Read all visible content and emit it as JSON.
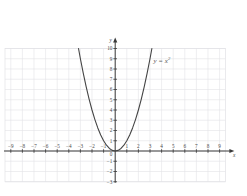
{
  "chart_data": {
    "type": "line",
    "title": "",
    "subtitle": "",
    "xlabel": "x",
    "ylabel": "y",
    "xlim": [
      -9.5,
      9.5
    ],
    "ylim": [
      -3,
      10
    ],
    "grid": true,
    "grid_step": 1,
    "legend": "none",
    "annotations": [
      {
        "text": "y = x",
        "superscript": "2",
        "x": 3.3,
        "y": 8.6
      }
    ],
    "x_ticks": [
      -9,
      -8,
      -7,
      -6,
      -5,
      -4,
      -3,
      -2,
      -1,
      1,
      2,
      3,
      4,
      5,
      6,
      7,
      8,
      9
    ],
    "x_tick_labels": [
      "−9",
      "−8",
      "−7",
      "−6",
      "−5",
      "−4",
      "−3",
      "−2",
      "−1",
      "1",
      "2",
      "3",
      "4",
      "5",
      "6",
      "7",
      "8",
      "9"
    ],
    "y_ticks": [
      -3,
      -2,
      -1,
      1,
      2,
      3,
      4,
      5,
      6,
      7,
      8,
      9,
      10
    ],
    "y_tick_labels": [
      "−3",
      "−2",
      "−1",
      "1",
      "2",
      "3",
      "4",
      "5",
      "6",
      "7",
      "8",
      "9",
      "10"
    ],
    "origin_label": "0",
    "series": [
      {
        "name": "y = x^2",
        "equation": "y = x^2",
        "color": "#444444",
        "width": 1.1,
        "points": [
          {
            "x": -3.1623,
            "y": 10.0
          },
          {
            "x": -3.0,
            "y": 9.0
          },
          {
            "x": -2.75,
            "y": 7.5625
          },
          {
            "x": -2.5,
            "y": 6.25
          },
          {
            "x": -2.25,
            "y": 5.0625
          },
          {
            "x": -2.0,
            "y": 4.0
          },
          {
            "x": -1.75,
            "y": 3.0625
          },
          {
            "x": -1.5,
            "y": 2.25
          },
          {
            "x": -1.25,
            "y": 1.5625
          },
          {
            "x": -1.0,
            "y": 1.0
          },
          {
            "x": -0.75,
            "y": 0.5625
          },
          {
            "x": -0.5,
            "y": 0.25
          },
          {
            "x": -0.25,
            "y": 0.0625
          },
          {
            "x": 0.0,
            "y": 0.0
          },
          {
            "x": 0.25,
            "y": 0.0625
          },
          {
            "x": 0.5,
            "y": 0.25
          },
          {
            "x": 0.75,
            "y": 0.5625
          },
          {
            "x": 1.0,
            "y": 1.0
          },
          {
            "x": 1.25,
            "y": 1.5625
          },
          {
            "x": 1.5,
            "y": 2.25
          },
          {
            "x": 1.75,
            "y": 3.0625
          },
          {
            "x": 2.0,
            "y": 4.0
          },
          {
            "x": 2.25,
            "y": 5.0625
          },
          {
            "x": 2.5,
            "y": 6.25
          },
          {
            "x": 2.75,
            "y": 7.5625
          },
          {
            "x": 3.0,
            "y": 9.0
          },
          {
            "x": 3.1623,
            "y": 10.0
          }
        ]
      }
    ],
    "colors": {
      "background": "#ffffff",
      "grid": "#e2e2e6",
      "axis": "#3a3a3a",
      "curve": "#444444",
      "text": "#4a4a4a"
    }
  }
}
